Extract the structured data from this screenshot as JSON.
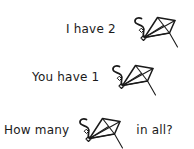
{
  "page": {
    "kind": "math-word-problem-worksheet",
    "background_color": "#ffffff",
    "ink_color": "#1a1a1a"
  },
  "problem": {
    "lines": [
      {
        "id": "line-1",
        "text_before": "I have 2",
        "object_icon": "kite-icon",
        "object_count": "2",
        "text_after": ""
      },
      {
        "id": "line-2",
        "text_before": "You have 1",
        "object_icon": "kite-icon",
        "object_count": "1",
        "text_after": ""
      },
      {
        "id": "line-3",
        "text_before": "How many",
        "object_icon": "kite-icon",
        "object_count": "",
        "text_after": "in all?"
      }
    ]
  }
}
